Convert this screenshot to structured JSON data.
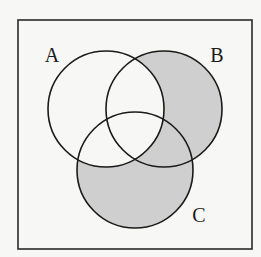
{
  "diagram": {
    "type": "venn",
    "universe": {
      "label": "",
      "stroke": "#2a2a2a"
    },
    "sets": [
      {
        "id": "A",
        "label": "A",
        "cx": 106,
        "cy": 109,
        "r": 58,
        "label_x": 52,
        "label_y": 62
      },
      {
        "id": "B",
        "label": "B",
        "cx": 164,
        "cy": 109,
        "r": 58,
        "label_x": 217,
        "label_y": 62
      },
      {
        "id": "C",
        "label": "C",
        "cx": 135,
        "cy": 170,
        "r": 58,
        "label_x": 199,
        "label_y": 222
      }
    ],
    "shaded_region": "(B ∪ C) − A",
    "shaded_color": "#cfcfcf",
    "unshaded_color": "#f7f7f5",
    "stroke_color": "#1a1a1a"
  }
}
